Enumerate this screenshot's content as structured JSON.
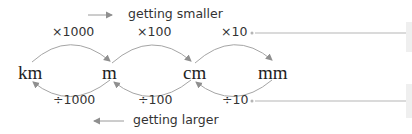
{
  "direction": {
    "smaller_label": "getting smaller",
    "larger_label": "getting larger"
  },
  "units": [
    {
      "label": "km"
    },
    {
      "label": "m"
    },
    {
      "label": "cm"
    },
    {
      "label": "mm"
    }
  ],
  "multiply": [
    {
      "label": "×1000"
    },
    {
      "label": "×100"
    },
    {
      "label": "×10"
    }
  ],
  "divide": [
    {
      "label": "÷1000"
    },
    {
      "label": "÷100"
    },
    {
      "label": "÷10"
    }
  ],
  "colors": {
    "arrow": "#9a9a9a",
    "text": "#333333",
    "unit_text": "#222222",
    "leader_line": "#b5b5b5",
    "side_box": "#efefef"
  }
}
